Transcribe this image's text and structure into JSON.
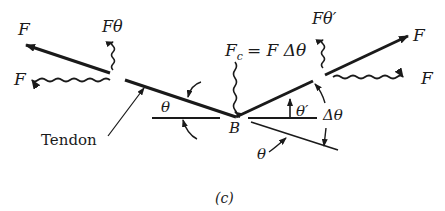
{
  "figure": {
    "caption": "(c)",
    "labels": {
      "f_left_top": "F",
      "f_left_bottom": "F",
      "f_theta": "Fθ",
      "fc_eq": "F",
      "fc_sub": "c",
      "fc_rhs": "= F Δθ",
      "f_theta_prime": "Fθ′",
      "f_right_top": "F",
      "f_right_bottom": "F",
      "tendon": "Tendon",
      "theta_left": "θ",
      "point_b": "B",
      "theta_prime": "θ′",
      "delta_theta": "Δθ",
      "theta_bottom": "θ"
    }
  },
  "colors": {
    "ink": "#1a1a1a",
    "background": "#ffffff"
  }
}
